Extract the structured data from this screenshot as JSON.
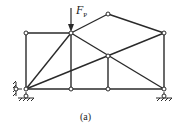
{
  "diagram": {
    "load_label": "F",
    "load_subscript": "P",
    "caption": "(a)",
    "colors": {
      "member": "#2a2a2a",
      "node_fill": "#ffffff",
      "hatch": "#555555"
    }
  }
}
